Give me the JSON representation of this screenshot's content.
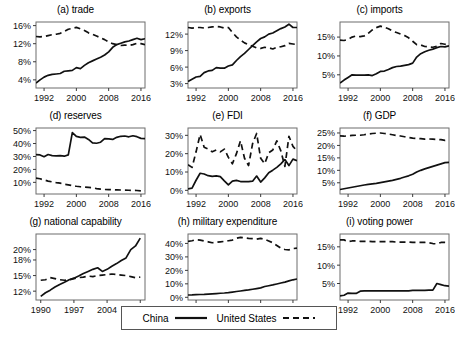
{
  "legend": {
    "entries": [
      {
        "label": "China",
        "style": "solid",
        "color": "#111111"
      },
      {
        "label": "United States",
        "style": "dashed",
        "color": "#111111"
      }
    ]
  },
  "chart_data": [
    {
      "type": "line",
      "panel": "a",
      "title": "(a) trade",
      "xlabel": "",
      "ylabel": "",
      "xlim": [
        1990,
        2017
      ],
      "ylim": [
        2.2,
        16.8
      ],
      "xticks": [
        1992,
        2000,
        2008,
        2016
      ],
      "yticks": [
        4,
        8,
        12,
        16
      ],
      "ytick_labels": [
        "4%",
        "8%",
        "12%",
        "16%"
      ],
      "grid": false,
      "x": [
        1990,
        1991,
        1992,
        1993,
        1994,
        1995,
        1996,
        1997,
        1998,
        1999,
        2000,
        2001,
        2002,
        2003,
        2004,
        2005,
        2006,
        2007,
        2008,
        2009,
        2010,
        2011,
        2012,
        2013,
        2014,
        2015,
        2016,
        2017
      ],
      "series": [
        {
          "name": "China",
          "style": "solid",
          "values": [
            3.3,
            4.0,
            4.6,
            5.0,
            5.2,
            5.3,
            5.4,
            5.9,
            6.0,
            6.1,
            6.7,
            6.5,
            7.2,
            7.8,
            8.2,
            8.6,
            9.0,
            9.5,
            10.2,
            11.2,
            11.8,
            12.1,
            12.4,
            12.6,
            12.9,
            13.2,
            12.9,
            13.1
          ]
        },
        {
          "name": "United States",
          "style": "dashed",
          "values": [
            13.6,
            13.5,
            13.6,
            13.8,
            14.0,
            14.1,
            14.3,
            14.7,
            15.2,
            15.4,
            15.6,
            15.3,
            14.9,
            14.4,
            14.1,
            13.7,
            13.3,
            12.9,
            12.4,
            12.0,
            11.8,
            11.6,
            11.7,
            11.6,
            11.8,
            12.1,
            12.0,
            11.8
          ]
        }
      ]
    },
    {
      "type": "line",
      "panel": "b",
      "title": "(b) exports",
      "xlabel": "",
      "ylabel": "",
      "xlim": [
        1990,
        2017
      ],
      "ylim": [
        2.2,
        14.2
      ],
      "xticks": [
        1992,
        2000,
        2008,
        2016
      ],
      "yticks": [
        3,
        6,
        9,
        12
      ],
      "ytick_labels": [
        "3%",
        "6%",
        "9%",
        "12%"
      ],
      "grid": false,
      "x": [
        1990,
        1991,
        1992,
        1993,
        1994,
        1995,
        1996,
        1997,
        1998,
        1999,
        2000,
        2001,
        2002,
        2003,
        2004,
        2005,
        2006,
        2007,
        2008,
        2009,
        2010,
        2011,
        2012,
        2013,
        2014,
        2015,
        2016,
        2017
      ],
      "series": [
        {
          "name": "China",
          "style": "solid",
          "values": [
            3.4,
            3.8,
            4.2,
            4.3,
            5.0,
            5.3,
            5.4,
            5.9,
            5.8,
            5.8,
            6.2,
            6.4,
            7.2,
            7.9,
            8.5,
            9.2,
            9.9,
            10.6,
            11.2,
            11.5,
            12.0,
            12.2,
            12.6,
            13.0,
            13.3,
            13.8,
            13.2,
            13.2
          ]
        },
        {
          "name": "United States",
          "style": "dashed",
          "values": [
            13.2,
            13.1,
            13.2,
            13.2,
            13.1,
            13.2,
            13.3,
            13.4,
            13.3,
            13.1,
            13.2,
            12.3,
            11.5,
            10.9,
            10.4,
            10.1,
            9.8,
            9.5,
            9.4,
            9.6,
            9.5,
            9.3,
            9.6,
            9.7,
            9.9,
            10.3,
            10.2,
            10.1
          ]
        }
      ]
    },
    {
      "type": "line",
      "panel": "c",
      "title": "(c) imports",
      "xlabel": "",
      "ylabel": "",
      "xlim": [
        1990,
        2017
      ],
      "ylim": [
        1.5,
        19.0
      ],
      "xticks": [
        1992,
        2000,
        2008,
        2016
      ],
      "yticks": [
        5,
        10,
        15
      ],
      "ytick_labels": [
        "5%",
        "10%",
        "15%"
      ],
      "grid": false,
      "x": [
        1990,
        1991,
        1992,
        1993,
        1994,
        1995,
        1996,
        1997,
        1998,
        1999,
        2000,
        2001,
        2002,
        2003,
        2004,
        2005,
        2006,
        2007,
        2008,
        2009,
        2010,
        2011,
        2012,
        2013,
        2014,
        2015,
        2016,
        2017
      ],
      "series": [
        {
          "name": "China",
          "style": "solid",
          "values": [
            2.8,
            3.6,
            4.3,
            5.0,
            4.9,
            4.9,
            4.9,
            5.0,
            4.8,
            5.3,
            5.9,
            6.0,
            6.4,
            6.9,
            7.2,
            7.3,
            7.5,
            7.7,
            8.1,
            9.7,
            10.6,
            11.1,
            11.5,
            11.8,
            12.2,
            12.5,
            12.4,
            12.7
          ]
        },
        {
          "name": "United States",
          "style": "dashed",
          "values": [
            14.2,
            14.1,
            14.4,
            15.0,
            15.3,
            15.1,
            15.3,
            16.0,
            16.9,
            17.5,
            17.9,
            17.6,
            17.2,
            16.6,
            16.2,
            15.8,
            15.4,
            14.8,
            13.9,
            13.0,
            12.9,
            12.5,
            12.4,
            12.3,
            12.6,
            13.3,
            13.1,
            12.9
          ]
        }
      ]
    },
    {
      "type": "line",
      "panel": "d",
      "title": "(d) reserves",
      "xlabel": "",
      "ylabel": "",
      "xlim": [
        1990,
        2017
      ],
      "ylim": [
        1.0,
        52.0
      ],
      "xticks": [
        1992,
        2000,
        2008,
        2016
      ],
      "yticks": [
        10,
        20,
        30,
        40,
        50
      ],
      "ytick_labels": [
        "10%",
        "20%",
        "30%",
        "40%",
        "50%"
      ],
      "grid": false,
      "x": [
        1990,
        1991,
        1992,
        1993,
        1994,
        1995,
        1996,
        1997,
        1998,
        1999,
        2000,
        2001,
        2002,
        2003,
        2004,
        2005,
        2006,
        2007,
        2008,
        2009,
        2010,
        2011,
        2012,
        2013,
        2014,
        2015,
        2016,
        2017
      ],
      "series": [
        {
          "name": "China",
          "style": "solid",
          "values": [
            31.5,
            31.2,
            29.8,
            31.5,
            30.7,
            30.5,
            30.6,
            30.2,
            31.2,
            48.5,
            45.5,
            44.8,
            45.0,
            43.2,
            40.5,
            40.2,
            41.0,
            43.8,
            43.6,
            43.2,
            44.8,
            45.6,
            45.8,
            45.2,
            46.0,
            45.3,
            44.0,
            43.8
          ]
        },
        {
          "name": "United States",
          "style": "dashed",
          "values": [
            13.2,
            12.8,
            11.8,
            11.0,
            10.4,
            9.8,
            9.4,
            8.5,
            8.1,
            7.5,
            7.0,
            6.6,
            6.4,
            6.1,
            5.8,
            5.2,
            4.8,
            4.5,
            4.4,
            4.3,
            4.2,
            4.1,
            4.0,
            3.9,
            3.8,
            3.7,
            3.4,
            3.5
          ]
        }
      ]
    },
    {
      "type": "line",
      "panel": "e",
      "title": "(e) FDI",
      "xlabel": "",
      "ylabel": "",
      "xlim": [
        1990,
        2017
      ],
      "ylim": [
        -2.0,
        34.0
      ],
      "xticks": [
        1992,
        2000,
        2008,
        2016
      ],
      "yticks": [
        0,
        10,
        20,
        30
      ],
      "ytick_labels": [
        "0%",
        "10%",
        "20%",
        "30%"
      ],
      "grid": false,
      "x": [
        1990,
        1991,
        1992,
        1993,
        1994,
        1995,
        1996,
        1997,
        1998,
        1999,
        2000,
        2001,
        2002,
        2003,
        2004,
        2005,
        2006,
        2007,
        2008,
        2009,
        2010,
        2011,
        2012,
        2013,
        2014,
        2015,
        2016,
        2017
      ],
      "series": [
        {
          "name": "China",
          "style": "solid",
          "values": [
            0.8,
            1.2,
            5.5,
            9.3,
            8.9,
            8.0,
            7.6,
            7.9,
            7.5,
            5.2,
            3.0,
            5.0,
            5.4,
            4.8,
            4.8,
            4.8,
            5.0,
            7.8,
            4.5,
            6.8,
            9.6,
            11.0,
            12.5,
            14.4,
            16.8,
            13.5,
            17.0,
            16.2
          ]
        },
        {
          "name": "United States",
          "style": "dashed",
          "values": [
            14.0,
            12.5,
            21.0,
            30.5,
            23.5,
            22.5,
            21.0,
            22.0,
            21.0,
            22.5,
            18.0,
            14.5,
            20.0,
            27.0,
            17.5,
            13.5,
            25.5,
            31.0,
            17.5,
            14.5,
            20.5,
            22.0,
            27.0,
            21.5,
            13.0,
            29.5,
            24.0,
            21.5
          ]
        }
      ]
    },
    {
      "type": "line",
      "panel": "f",
      "title": "(f) GDP",
      "xlabel": "",
      "ylabel": "",
      "xlim": [
        1990,
        2017
      ],
      "ylim": [
        0.5,
        27.0
      ],
      "xticks": [
        1992,
        2000,
        2008,
        2016
      ],
      "yticks": [
        5,
        10,
        15,
        20,
        25
      ],
      "ytick_labels": [
        "5%",
        "10%",
        "15%",
        "20%",
        "25%"
      ],
      "grid": false,
      "x": [
        1990,
        1991,
        1992,
        1993,
        1994,
        1995,
        1996,
        1997,
        1998,
        1999,
        2000,
        2001,
        2002,
        2003,
        2004,
        2005,
        2006,
        2007,
        2008,
        2009,
        2010,
        2011,
        2012,
        2013,
        2014,
        2015,
        2016,
        2017
      ],
      "series": [
        {
          "name": "China",
          "style": "solid",
          "values": [
            2.3,
            2.6,
            2.9,
            3.2,
            3.5,
            3.8,
            4.1,
            4.4,
            4.6,
            4.8,
            5.1,
            5.4,
            5.7,
            6.0,
            6.4,
            6.8,
            7.3,
            7.8,
            8.4,
            9.3,
            10.0,
            10.6,
            11.1,
            11.6,
            12.1,
            12.6,
            13.1,
            13.2
          ]
        },
        {
          "name": "United States",
          "style": "dashed",
          "values": [
            23.8,
            23.7,
            23.9,
            24.0,
            24.1,
            24.1,
            24.3,
            24.6,
            24.8,
            24.9,
            25.0,
            24.8,
            24.6,
            24.3,
            24.0,
            23.8,
            23.5,
            23.2,
            22.9,
            22.8,
            22.7,
            22.5,
            22.6,
            22.5,
            22.4,
            22.3,
            22.0,
            22.2
          ]
        }
      ]
    },
    {
      "type": "line",
      "panel": "g",
      "title": "(g) national capability",
      "xlabel": "",
      "ylabel": "",
      "xlim": [
        1989,
        2012
      ],
      "ylim": [
        10.3,
        23.0
      ],
      "xticks": [
        1990,
        1997,
        2004,
        2011
      ],
      "yticks": [
        12,
        15,
        18,
        20
      ],
      "ytick_labels": [
        "12%",
        "15%",
        "18%",
        "20%"
      ],
      "grid": false,
      "x": [
        1990,
        1991,
        1992,
        1993,
        1994,
        1995,
        1996,
        1997,
        1998,
        1999,
        2000,
        2001,
        2002,
        2003,
        2004,
        2005,
        2006,
        2007,
        2008,
        2009,
        2010,
        2011
      ],
      "series": [
        {
          "name": "China",
          "style": "solid",
          "values": [
            11.0,
            11.7,
            12.2,
            12.8,
            13.3,
            13.7,
            14.2,
            14.5,
            14.9,
            15.4,
            15.8,
            16.2,
            16.5,
            15.8,
            16.2,
            16.8,
            17.3,
            17.9,
            18.4,
            20.0,
            20.7,
            22.2
          ]
        },
        {
          "name": "United States",
          "style": "dashed",
          "values": [
            14.1,
            14.2,
            14.6,
            14.4,
            14.2,
            14.1,
            14.2,
            14.4,
            14.6,
            14.7,
            14.9,
            14.8,
            15.0,
            15.1,
            15.2,
            15.3,
            15.2,
            15.1,
            15.0,
            14.8,
            14.6,
            14.7
          ]
        }
      ]
    },
    {
      "type": "line",
      "panel": "h",
      "title": "(h) military expenditure",
      "xlabel": "",
      "ylabel": "",
      "xlim": [
        1990,
        2017
      ],
      "ylim": [
        -2.0,
        47.0
      ],
      "xticks": [
        1992,
        2000,
        2008,
        2016
      ],
      "yticks": [
        0,
        10,
        20,
        30,
        40
      ],
      "ytick_labels": [
        "0%",
        "10%",
        "20%",
        "30%",
        "40%"
      ],
      "grid": false,
      "x": [
        1990,
        1991,
        1992,
        1993,
        1994,
        1995,
        1996,
        1997,
        1998,
        1999,
        2000,
        2001,
        2002,
        2003,
        2004,
        2005,
        2006,
        2007,
        2008,
        2009,
        2010,
        2011,
        2012,
        2013,
        2014,
        2015,
        2016,
        2017
      ],
      "series": [
        {
          "name": "China",
          "style": "solid",
          "values": [
            1.7,
            1.8,
            2.0,
            2.1,
            2.2,
            2.4,
            2.6,
            2.8,
            3.0,
            3.2,
            3.5,
            3.9,
            4.3,
            4.7,
            5.1,
            5.5,
            6.0,
            6.5,
            7.0,
            8.0,
            8.6,
            9.2,
            9.9,
            10.6,
            11.3,
            12.2,
            13.0,
            13.6
          ]
        },
        {
          "name": "United States",
          "style": "dashed",
          "values": [
            41.5,
            42.0,
            42.8,
            42.5,
            41.8,
            41.2,
            40.5,
            40.8,
            41.2,
            41.5,
            42.0,
            42.5,
            43.8,
            44.5,
            44.2,
            43.8,
            43.5,
            43.2,
            43.8,
            43.0,
            41.8,
            40.5,
            38.5,
            36.5,
            35.5,
            35.2,
            36.2,
            36.5
          ]
        }
      ]
    },
    {
      "type": "line",
      "panel": "i",
      "title": "(i) voting power",
      "xlabel": "",
      "ylabel": "",
      "xlim": [
        1990,
        2017
      ],
      "ylim": [
        0.5,
        18.5
      ],
      "xticks": [
        1992,
        2000,
        2008,
        2016
      ],
      "yticks": [
        5,
        10,
        15
      ],
      "ytick_labels": [
        "5%",
        "10%",
        "15%"
      ],
      "grid": false,
      "x": [
        1990,
        1991,
        1992,
        1993,
        1994,
        1995,
        1996,
        1997,
        1998,
        1999,
        2000,
        2001,
        2002,
        2003,
        2004,
        2005,
        2006,
        2007,
        2008,
        2009,
        2010,
        2011,
        2012,
        2013,
        2014,
        2015,
        2016,
        2017
      ],
      "series": [
        {
          "name": "China",
          "style": "solid",
          "values": [
            1.6,
            1.8,
            2.4,
            2.3,
            2.3,
            2.9,
            3.0,
            3.0,
            3.0,
            3.0,
            3.0,
            3.0,
            3.0,
            3.0,
            3.0,
            3.0,
            3.0,
            3.0,
            3.1,
            3.1,
            3.1,
            3.1,
            3.2,
            3.2,
            5.0,
            4.7,
            4.4,
            4.3
          ]
        },
        {
          "name": "United States",
          "style": "dashed",
          "values": [
            16.9,
            16.9,
            16.4,
            16.6,
            16.6,
            16.5,
            16.5,
            16.5,
            16.4,
            16.4,
            16.4,
            16.4,
            16.4,
            16.4,
            16.3,
            16.3,
            16.3,
            16.3,
            16.2,
            16.2,
            16.2,
            16.2,
            16.1,
            15.9,
            15.8,
            16.2,
            16.2,
            16.2
          ]
        }
      ]
    }
  ]
}
